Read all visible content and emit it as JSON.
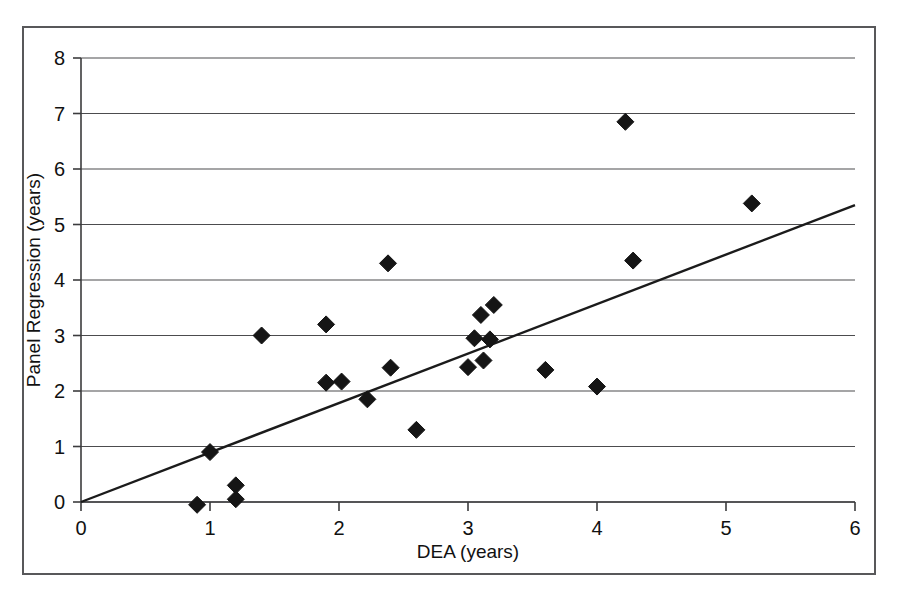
{
  "chart_data": {
    "type": "scatter",
    "title": "",
    "xlabel": "DEA (years)",
    "ylabel": "Panel Regression (years)",
    "xlim": [
      0,
      6
    ],
    "ylim": [
      0,
      8
    ],
    "xticks": [
      "0",
      "1",
      "2",
      "3",
      "4",
      "5",
      "6"
    ],
    "yticks": [
      "0",
      "1",
      "2",
      "3",
      "4",
      "5",
      "6",
      "7",
      "8"
    ],
    "grid": "horizontal",
    "legend": "none",
    "marker_style": "filled-diamond",
    "marker_color": "#151515",
    "series": [
      {
        "name": "observations",
        "points": [
          [
            0.9,
            -0.05
          ],
          [
            1.0,
            0.9
          ],
          [
            1.2,
            0.3
          ],
          [
            1.2,
            0.05
          ],
          [
            1.4,
            3.0
          ],
          [
            1.9,
            2.15
          ],
          [
            1.9,
            3.2
          ],
          [
            2.02,
            2.17
          ],
          [
            2.22,
            1.85
          ],
          [
            2.38,
            4.3
          ],
          [
            2.4,
            2.42
          ],
          [
            2.6,
            1.3
          ],
          [
            3.0,
            2.43
          ],
          [
            3.05,
            2.95
          ],
          [
            3.1,
            3.37
          ],
          [
            3.12,
            2.55
          ],
          [
            3.17,
            2.93
          ],
          [
            3.2,
            3.55
          ],
          [
            3.6,
            2.38
          ],
          [
            4.0,
            2.08
          ],
          [
            4.22,
            6.85
          ],
          [
            4.28,
            4.35
          ],
          [
            5.2,
            5.38
          ]
        ]
      }
    ],
    "trendline": {
      "name": "fit-line",
      "from": [
        0,
        0
      ],
      "to": [
        6,
        5.35
      ],
      "slope": 0.892,
      "intercept": 0
    }
  }
}
